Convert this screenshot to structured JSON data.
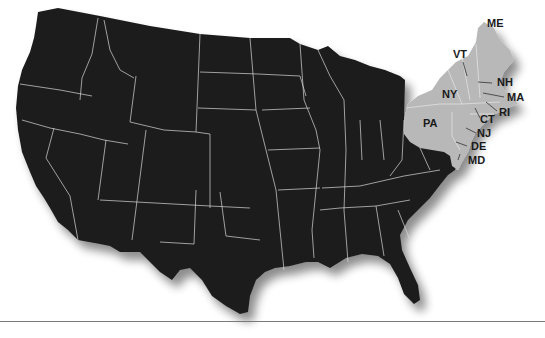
{
  "map": {
    "subject": "United States",
    "colors": {
      "base_fill": "#1c1c1c",
      "highlight_fill": "#b8b8b8",
      "border": "#d8d8d8",
      "label": "#1a1a1a",
      "baseline": "#7a7a7a"
    },
    "highlighted_states": [
      {
        "code": "ME",
        "label": "ME",
        "x": 487,
        "y": 27
      },
      {
        "code": "VT",
        "label": "VT",
        "x": 453,
        "y": 58
      },
      {
        "code": "NH",
        "label": "NH",
        "x": 497,
        "y": 86
      },
      {
        "code": "NY",
        "label": "NY",
        "x": 442,
        "y": 98
      },
      {
        "code": "MA",
        "label": "MA",
        "x": 507,
        "y": 101
      },
      {
        "code": "RI",
        "label": "RI",
        "x": 499,
        "y": 116
      },
      {
        "code": "PA",
        "label": "PA",
        "x": 423,
        "y": 127
      },
      {
        "code": "CT",
        "label": "CT",
        "x": 480,
        "y": 123
      },
      {
        "code": "NJ",
        "label": "NJ",
        "x": 477,
        "y": 137
      },
      {
        "code": "DE",
        "label": "DE",
        "x": 471,
        "y": 150
      },
      {
        "code": "MD",
        "label": "MD",
        "x": 468,
        "y": 164
      }
    ]
  }
}
